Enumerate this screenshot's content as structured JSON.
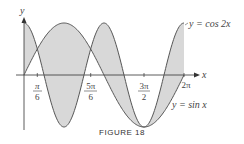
{
  "chart_data": {
    "type": "area",
    "title": "",
    "caption": "FIGURE 18",
    "xlabel": "x",
    "ylabel": "y",
    "x_ticks": [
      "π/6",
      "5π/6",
      "3π/2",
      "2π"
    ],
    "x_tick_values": [
      0.5236,
      2.618,
      4.712,
      6.2832
    ],
    "xlim": [
      0,
      6.2832
    ],
    "ylim": [
      -1,
      1
    ],
    "series": [
      {
        "name": "y = cos 2x",
        "function": "cos(2x)"
      },
      {
        "name": "y = sin x",
        "function": "sin(x)"
      }
    ],
    "shaded_region": "area between y = cos 2x and y = sin x on [0, 2π]",
    "intersections": [
      "π/6",
      "5π/6",
      "3π/2"
    ],
    "colors": {
      "curve": "#555555",
      "fill": "#d9d9d9",
      "axis": "#333333"
    }
  },
  "labels": {
    "y_axis": "y",
    "x_axis": "x",
    "curve1": "y = cos 2x",
    "curve2": "y = sin x",
    "tick1_num": "π",
    "tick1_den": "6",
    "tick2_num": "5π",
    "tick2_den": "6",
    "tick3_num": "3π",
    "tick3_den": "2",
    "tick4": "2π",
    "caption": "FIGURE 18"
  }
}
